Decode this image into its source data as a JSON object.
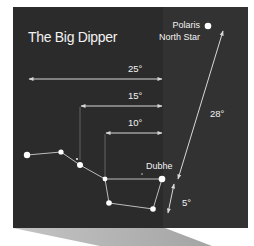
{
  "title": "The Big Dipper",
  "colors": {
    "panel": "#2b2b2b",
    "panel_right": "#323232",
    "shadow": "#b0b0b0",
    "line": "#d8d8d8",
    "text": "#f2f2f2",
    "star": "#ffffff"
  },
  "polaris": {
    "name": "Polaris",
    "subtitle": "North Star"
  },
  "stars": [
    {
      "id": "alkaid",
      "x": 27,
      "y": 155,
      "r": 3.2
    },
    {
      "id": "mizar",
      "x": 61,
      "y": 152,
      "r": 2.6
    },
    {
      "id": "alcor",
      "x": 77,
      "y": 159,
      "r": 1.1
    },
    {
      "id": "alioth",
      "x": 80,
      "y": 165,
      "r": 3.0
    },
    {
      "id": "megrez",
      "x": 105,
      "y": 179,
      "r": 2.4
    },
    {
      "id": "dubhe",
      "x": 162,
      "y": 179,
      "r": 3.3,
      "label": "Dubhe"
    },
    {
      "id": "merak",
      "x": 153,
      "y": 209,
      "r": 2.8
    },
    {
      "id": "phecda",
      "x": 109,
      "y": 203,
      "r": 2.8
    },
    {
      "id": "polaris",
      "x": 208,
      "y": 26,
      "r": 3.3
    }
  ],
  "distances": [
    {
      "label": "25°",
      "from_x": 28,
      "to_x": 162,
      "y": 79
    },
    {
      "label": "15°",
      "from_x": 80,
      "to_x": 162,
      "y": 106
    },
    {
      "label": "10°",
      "from_x": 105,
      "to_x": 162,
      "y": 133
    },
    {
      "label": "28°",
      "description": "Dubhe to Polaris"
    },
    {
      "label": "5°",
      "description": "Merak to Dubhe"
    }
  ]
}
